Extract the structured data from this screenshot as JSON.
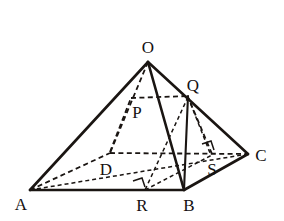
{
  "figure": {
    "type": "geometry-diagram",
    "canvas": {
      "width": 284,
      "height": 221
    },
    "stroke_color": "#1a1512",
    "background_color": "#ffffff"
  },
  "vertices": {
    "O": {
      "label": "O",
      "x": 148,
      "y": 62,
      "label_x": 148,
      "label_y": 47
    },
    "A": {
      "label": "A",
      "x": 30,
      "y": 190,
      "label_x": 21,
      "label_y": 203
    },
    "B": {
      "label": "B",
      "x": 184,
      "y": 190,
      "label_x": 188,
      "label_y": 204
    },
    "C": {
      "label": "C",
      "x": 248,
      "y": 154,
      "label_x": 260,
      "label_y": 155
    },
    "D": {
      "label": "D",
      "x": 110,
      "y": 153,
      "label_x": 106,
      "label_y": 169
    },
    "P": {
      "label": "P",
      "x": 134,
      "y": 98,
      "label_x": 137,
      "label_y": 112
    },
    "Q": {
      "label": "Q",
      "x": 188,
      "y": 96,
      "label_x": 192,
      "label_y": 85
    },
    "R": {
      "label": "R",
      "x": 145,
      "y": 190,
      "label_x": 141,
      "label_y": 204
    },
    "S": {
      "label": "S",
      "x": 212,
      "y": 155,
      "label_x": 212,
      "label_y": 169
    }
  },
  "edges": {
    "solid": [
      {
        "name": "edge-A-B",
        "from": "A",
        "to": "B"
      },
      {
        "name": "edge-B-C",
        "from": "B",
        "to": "C"
      },
      {
        "name": "edge-O-A",
        "from": "O",
        "to": "A"
      },
      {
        "name": "edge-O-B",
        "from": "O",
        "to": "B"
      },
      {
        "name": "edge-O-C",
        "from": "O",
        "to": "C"
      },
      {
        "name": "edge-Q-B",
        "from": "Q",
        "to": "B"
      }
    ],
    "dashed": [
      {
        "name": "edge-A-D",
        "from": "A",
        "to": "D"
      },
      {
        "name": "edge-D-C",
        "from": "D",
        "to": "C"
      },
      {
        "name": "edge-O-D",
        "from": "O",
        "to": "D"
      },
      {
        "name": "edge-A-C",
        "from": "A",
        "to": "C"
      },
      {
        "name": "edge-P-Q",
        "from": "P",
        "to": "Q"
      },
      {
        "name": "edge-D-P",
        "from": "D",
        "to": "P"
      },
      {
        "name": "edge-S-Q",
        "from": "S",
        "to": "Q"
      },
      {
        "name": "edge-Q-R",
        "from": "Q",
        "to": "R"
      },
      {
        "name": "edge-Q-S-diag",
        "from": "Q",
        "to": "S"
      },
      {
        "name": "edge-R-B-base",
        "from": "R",
        "to": "S"
      }
    ]
  },
  "right_angle_marks": [
    {
      "name": "right-angle-at-R",
      "x": 140,
      "y": 183,
      "size": 9,
      "rotation": -18
    },
    {
      "name": "right-angle-at-S",
      "x": 207,
      "y": 146,
      "size": 9,
      "rotation": -18
    }
  ],
  "labels_list": [
    "O",
    "Q",
    "P",
    "C",
    "D",
    "S",
    "A",
    "R",
    "B"
  ]
}
